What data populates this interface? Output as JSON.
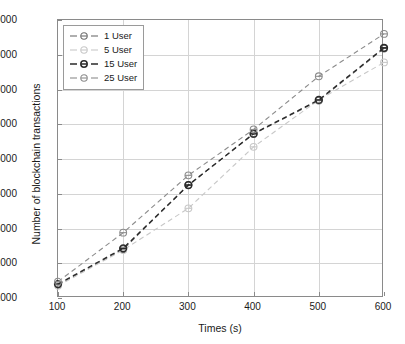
{
  "chart_data": {
    "type": "line",
    "title": "",
    "xlabel": "Times (s)",
    "ylabel": "Number of blockchain transactions",
    "x": [
      100,
      200,
      300,
      400,
      500,
      600
    ],
    "xlim": [
      100,
      600
    ],
    "ylim": [
      1000,
      9000
    ],
    "xticks": [
      "100",
      "200",
      "300",
      "400",
      "500",
      "600"
    ],
    "yticks": [
      "1000",
      "2000",
      "3000",
      "4000",
      "5000",
      "6000",
      "7000",
      "8000",
      "9000"
    ],
    "grid": true,
    "legend_position": "upper left",
    "linestyle": "dashed",
    "marker": "circle",
    "series": [
      {
        "name": "1 User",
        "color": "#6e6e6e",
        "values": [
          1380,
          2400,
          4250,
          5720,
          6680,
          8180
        ]
      },
      {
        "name": "5 User",
        "color": "#c8c8c8",
        "values": [
          1350,
          2380,
          3580,
          5350,
          6700,
          7780
        ]
      },
      {
        "name": "15 User",
        "color": "#2a2a2a",
        "values": [
          1400,
          2430,
          4250,
          5730,
          6700,
          8200
        ]
      },
      {
        "name": "25 User",
        "color": "#8c8c8c",
        "values": [
          1470,
          2880,
          4530,
          5850,
          7380,
          8600
        ]
      }
    ]
  },
  "legend": {
    "items": [
      {
        "label": "1 User"
      },
      {
        "label": "5 User"
      },
      {
        "label": "15 User"
      },
      {
        "label": "25 User"
      }
    ]
  }
}
